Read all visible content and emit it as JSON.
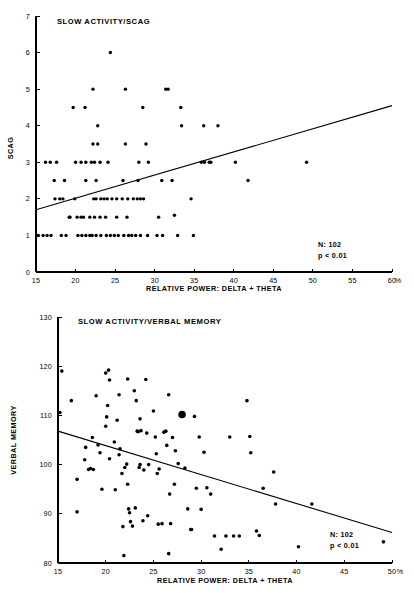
{
  "figure": {
    "background": "#ffffff",
    "ink_color": "#000000",
    "panel_count": 2
  },
  "chart_data": [
    {
      "id": "scag",
      "type": "scatter",
      "title": "SLOW ACTIVITY/SCAG",
      "xlabel": "RELATIVE POWER: DELTA + THETA",
      "ylabel": "SCAG",
      "x_unit": "%",
      "xlim": [
        15,
        60
      ],
      "ylim": [
        0,
        7
      ],
      "xticks": [
        15,
        20,
        25,
        30,
        35,
        40,
        45,
        50,
        55,
        60
      ],
      "yticks": [
        0,
        1,
        2,
        3,
        4,
        5,
        6,
        7
      ],
      "grid": false,
      "legend": "none",
      "annotations": {
        "n_label": "N: 102",
        "p_label": "p < 0.01"
      },
      "n": 102,
      "trendline": {
        "type": "linear",
        "x_start": 15,
        "y_start": 1.7,
        "x_end": 60,
        "y_end": 4.55,
        "direction": "positive"
      },
      "points": [
        [
          16.2,
          3.0
        ],
        [
          16.8,
          3.0
        ],
        [
          17.6,
          3.0
        ],
        [
          17.3,
          2.5
        ],
        [
          18.6,
          2.5
        ],
        [
          17.4,
          2.0
        ],
        [
          18.0,
          2.0
        ],
        [
          18.4,
          2.0
        ],
        [
          19.9,
          2.0
        ],
        [
          15.3,
          1.0
        ],
        [
          15.9,
          1.0
        ],
        [
          16.4,
          1.0
        ],
        [
          16.9,
          1.0
        ],
        [
          18.2,
          1.0
        ],
        [
          18.8,
          1.0
        ],
        [
          19.2,
          1.5
        ],
        [
          20.2,
          1.5
        ],
        [
          20.7,
          1.5
        ],
        [
          21.0,
          1.5
        ],
        [
          19.7,
          4.5
        ],
        [
          21.2,
          4.5
        ],
        [
          20.0,
          3.0
        ],
        [
          20.7,
          3.0
        ],
        [
          21.3,
          3.0
        ],
        [
          22.0,
          3.0
        ],
        [
          22.4,
          3.0
        ],
        [
          23.1,
          3.0
        ],
        [
          24.1,
          3.0
        ],
        [
          21.3,
          2.5
        ],
        [
          22.6,
          2.5
        ],
        [
          20.3,
          1.0
        ],
        [
          20.8,
          1.0
        ],
        [
          21.3,
          1.0
        ],
        [
          21.8,
          1.0
        ],
        [
          22.1,
          1.0
        ],
        [
          22.6,
          1.0
        ],
        [
          23.2,
          1.0
        ],
        [
          22.2,
          5.0
        ],
        [
          24.4,
          6.0
        ],
        [
          22.8,
          4.0
        ],
        [
          22.2,
          3.5
        ],
        [
          22.8,
          3.5
        ],
        [
          22.3,
          2.0
        ],
        [
          22.6,
          2.0
        ],
        [
          23.6,
          2.0
        ],
        [
          24.0,
          2.0
        ],
        [
          21.8,
          1.5
        ],
        [
          22.4,
          1.5
        ],
        [
          23.1,
          1.5
        ],
        [
          23.8,
          1.5
        ],
        [
          23.9,
          1.0
        ],
        [
          24.4,
          1.0
        ],
        [
          24.9,
          1.0
        ],
        [
          25.4,
          1.0
        ],
        [
          26.3,
          5.0
        ],
        [
          26.3,
          3.5
        ],
        [
          26.0,
          2.5
        ],
        [
          25.2,
          2.0
        ],
        [
          25.9,
          2.0
        ],
        [
          26.6,
          2.0
        ],
        [
          27.3,
          2.0
        ],
        [
          25.2,
          1.5
        ],
        [
          26.5,
          1.5
        ],
        [
          26.1,
          1.0
        ],
        [
          26.7,
          1.0
        ],
        [
          27.1,
          1.0
        ],
        [
          27.6,
          1.0
        ],
        [
          28.5,
          4.5
        ],
        [
          28.9,
          3.5
        ],
        [
          27.9,
          2.5
        ],
        [
          28.0,
          3.0
        ],
        [
          29.2,
          3.0
        ],
        [
          27.8,
          2.0
        ],
        [
          28.2,
          2.0
        ],
        [
          28.6,
          2.0
        ],
        [
          28.2,
          1.0
        ],
        [
          29.1,
          1.0
        ],
        [
          30.3,
          1.0
        ],
        [
          30.9,
          2.5
        ],
        [
          30.5,
          1.5
        ],
        [
          31.4,
          5.0
        ],
        [
          31.7,
          5.0
        ],
        [
          31.0,
          1.0
        ],
        [
          32.2,
          2.5
        ],
        [
          32.5,
          1.55
        ],
        [
          32.9,
          1.0
        ],
        [
          33.3,
          4.5
        ],
        [
          33.4,
          4.0
        ],
        [
          34.6,
          2.0
        ],
        [
          34.9,
          1.0
        ],
        [
          35.9,
          3.0
        ],
        [
          36.3,
          3.0
        ],
        [
          36.9,
          3.0
        ],
        [
          37.1,
          3.0
        ],
        [
          36.2,
          4.0
        ],
        [
          38.0,
          4.0
        ],
        [
          40.2,
          3.0
        ],
        [
          41.8,
          2.5
        ],
        [
          49.2,
          3.0
        ],
        [
          23.2,
          2.0
        ],
        [
          24.6,
          2.0
        ],
        [
          19.3,
          1.5
        ]
      ]
    },
    {
      "id": "verbal-memory",
      "type": "scatter",
      "title": "SLOW ACTIVITY/VERBAL MEMORY",
      "xlabel": "RELATIVE POWER: DELTA + THETA",
      "ylabel": "VERBAL MEMORY",
      "x_unit": "%",
      "xlim": [
        15,
        50
      ],
      "ylim": [
        80,
        130
      ],
      "xticks": [
        15,
        20,
        25,
        30,
        35,
        40,
        45,
        50
      ],
      "yticks": [
        80,
        90,
        100,
        110,
        120,
        130
      ],
      "grid": false,
      "legend": "none",
      "annotations": {
        "n_label": "N: 102",
        "p_label": "p < 0.01"
      },
      "n": 102,
      "trendline": {
        "type": "linear",
        "x_start": 15,
        "y_start": 106.8,
        "x_end": 50,
        "y_end": 86.2,
        "direction": "negative"
      },
      "highlight_point": {
        "x": 28.0,
        "y": 110.2,
        "size": "large"
      },
      "points": [
        [
          15.4,
          119.0
        ],
        [
          15.2,
          110.6
        ],
        [
          16.4,
          113.0
        ],
        [
          17.0,
          97.0
        ],
        [
          17.0,
          90.4
        ],
        [
          17.8,
          101.0
        ],
        [
          17.9,
          103.5
        ],
        [
          18.2,
          99.0
        ],
        [
          18.7,
          99.0
        ],
        [
          18.6,
          105.5
        ],
        [
          19.0,
          114.0
        ],
        [
          19.4,
          102.4
        ],
        [
          19.6,
          95.0
        ],
        [
          20.0,
          118.6
        ],
        [
          20.3,
          119.2
        ],
        [
          20.4,
          117.2
        ],
        [
          20.2,
          112.0
        ],
        [
          20.1,
          109.7
        ],
        [
          20.0,
          107.8
        ],
        [
          20.4,
          101.2
        ],
        [
          20.9,
          104.6
        ],
        [
          21.4,
          114.2
        ],
        [
          21.2,
          109.0
        ],
        [
          21.5,
          103.2
        ],
        [
          21.4,
          102.0
        ],
        [
          21.7,
          98.2
        ],
        [
          21.8,
          87.4
        ],
        [
          21.9,
          81.5
        ],
        [
          22.3,
          117.4
        ],
        [
          22.2,
          100.1
        ],
        [
          22.0,
          99.4
        ],
        [
          22.3,
          96.0
        ],
        [
          22.4,
          91.0
        ],
        [
          22.5,
          90.2
        ],
        [
          22.6,
          88.4
        ],
        [
          23.0,
          115.0
        ],
        [
          23.2,
          113.0
        ],
        [
          23.4,
          106.7
        ],
        [
          23.6,
          109.3
        ],
        [
          23.3,
          106.8
        ],
        [
          23.7,
          106.9
        ],
        [
          23.5,
          99.4
        ],
        [
          23.6,
          100.0
        ],
        [
          23.9,
          88.6
        ],
        [
          24.2,
          117.3
        ],
        [
          24.3,
          106.4
        ],
        [
          24.5,
          100.0
        ],
        [
          24.4,
          89.6
        ],
        [
          25.0,
          110.9
        ],
        [
          25.2,
          105.6
        ],
        [
          25.3,
          102.2
        ],
        [
          25.6,
          99.1
        ],
        [
          25.4,
          98.2
        ],
        [
          25.5,
          87.9
        ],
        [
          25.9,
          88.0
        ],
        [
          26.1,
          106.6
        ],
        [
          26.3,
          106.8
        ],
        [
          26.6,
          114.2
        ],
        [
          26.4,
          103.9
        ],
        [
          26.7,
          94.0
        ],
        [
          26.8,
          88.0
        ],
        [
          26.6,
          81.9
        ],
        [
          27.0,
          105.5
        ],
        [
          27.3,
          102.8
        ],
        [
          27.6,
          100.2
        ],
        [
          28.0,
          110.2
        ],
        [
          28.3,
          99.3
        ],
        [
          28.6,
          91.0
        ],
        [
          28.9,
          86.8
        ],
        [
          29.3,
          109.8
        ],
        [
          29.5,
          95.2
        ],
        [
          29.8,
          105.6
        ],
        [
          30.3,
          102.5
        ],
        [
          30.6,
          95.3
        ],
        [
          31.0,
          94.0
        ],
        [
          31.4,
          85.5
        ],
        [
          32.1,
          82.8
        ],
        [
          32.6,
          85.5
        ],
        [
          33.0,
          105.6
        ],
        [
          33.4,
          85.5
        ],
        [
          34.0,
          85.5
        ],
        [
          34.8,
          113.0
        ],
        [
          35.1,
          105.7
        ],
        [
          35.2,
          102.4
        ],
        [
          35.8,
          86.5
        ],
        [
          36.1,
          85.6
        ],
        [
          36.5,
          95.2
        ],
        [
          37.6,
          98.5
        ],
        [
          37.8,
          92.0
        ],
        [
          40.2,
          83.3
        ],
        [
          41.6,
          92.0
        ],
        [
          49.1,
          84.3
        ],
        [
          19.2,
          104.0
        ],
        [
          21.0,
          94.9
        ],
        [
          23.1,
          91.2
        ],
        [
          24.0,
          98.9
        ],
        [
          27.2,
          96.0
        ],
        [
          29.0,
          86.8
        ],
        [
          30.0,
          90.9
        ],
        [
          18.4,
          99.2
        ],
        [
          22.8,
          87.5
        ]
      ]
    }
  ]
}
